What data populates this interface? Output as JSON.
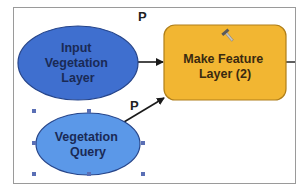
{
  "diagram": {
    "type": "model-builder",
    "nodes": [
      {
        "id": "input-vegetation-layer",
        "kind": "data-variable",
        "lines": [
          "Input",
          "Vegetation",
          "Layer"
        ],
        "fill": "#3f6fcf",
        "stroke": "#26458a",
        "text_color": "#1a2a55"
      },
      {
        "id": "make-feature-layer",
        "kind": "tool",
        "lines": [
          "Make Feature",
          "Layer (2)"
        ],
        "fill": "#f2b632",
        "stroke": "#b07f1a",
        "text_color": "#3a2a10"
      },
      {
        "id": "vegetation-query",
        "kind": "parameter-variable",
        "lines": [
          "Vegetation",
          "Query"
        ],
        "fill": "#5b98e8",
        "stroke": "#26458a",
        "text_color": "#1a2a55",
        "selected": true
      }
    ],
    "edges": [
      {
        "from": "input-vegetation-layer",
        "to": "make-feature-layer"
      },
      {
        "from": "vegetation-query",
        "to": "make-feature-layer"
      },
      {
        "from": "make-feature-layer",
        "to": "offscreen-output"
      }
    ],
    "parameter_markers": [
      {
        "node": "input-vegetation-layer",
        "label": "P"
      },
      {
        "node": "vegetation-query",
        "label": "P"
      }
    ],
    "tool_icon": "hammer-icon",
    "colors": {
      "frame": "#9a9a9a",
      "edge": "#1a1a1a",
      "selection_handle": "#5a6fb5",
      "background": "#ffffff"
    }
  }
}
